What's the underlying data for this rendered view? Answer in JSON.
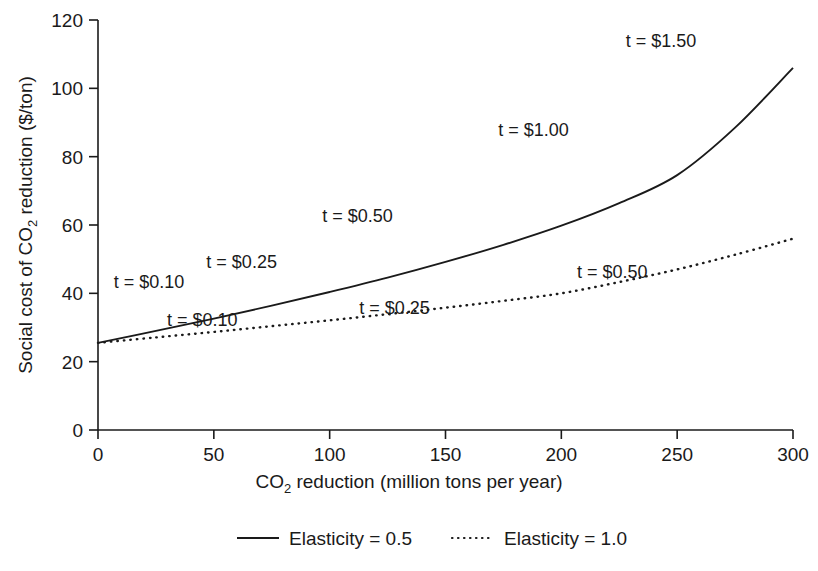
{
  "chart_data": {
    "type": "line",
    "title": "",
    "xlabel": "CO2 reduction (million tons per year)",
    "xlabel_parts": {
      "pre": "CO",
      "sub": "2",
      "post": " reduction (million tons per year)"
    },
    "ylabel": "Social cost of CO2 reduction ($/ton)",
    "ylabel_parts": {
      "pre": "Social cost of CO",
      "sub": "2",
      "post": " reduction ($/ton)"
    },
    "xlim": [
      0,
      300
    ],
    "ylim": [
      0,
      120
    ],
    "xticks": [
      0,
      50,
      100,
      150,
      200,
      250,
      300
    ],
    "xtick_labels": [
      "0",
      "50",
      "100",
      "150",
      "200",
      "250",
      "300"
    ],
    "yticks": [
      0,
      20,
      40,
      60,
      80,
      100,
      120
    ],
    "ytick_labels": [
      "0",
      "20",
      "40",
      "60",
      "80",
      "100",
      "120"
    ],
    "grid": false,
    "legend_position": "below",
    "series": [
      {
        "name": "Elasticity = 0.5",
        "style": "solid",
        "x": [
          0,
          25,
          50,
          75,
          100,
          125,
          150,
          175,
          200,
          225,
          250,
          275,
          300
        ],
        "values": [
          25.5,
          29.0,
          32.6,
          36.4,
          40.4,
          44.6,
          49.2,
          54.2,
          59.8,
          66.4,
          74.6,
          88.5,
          106.0
        ]
      },
      {
        "name": "Elasticity = 1.0",
        "style": "dotted",
        "x": [
          0,
          25,
          50,
          75,
          100,
          125,
          150,
          175,
          200,
          225,
          250,
          275,
          300
        ],
        "values": [
          25.5,
          27.1,
          28.7,
          30.4,
          32.1,
          33.9,
          35.8,
          37.8,
          40.0,
          43.3,
          47.0,
          51.3,
          56.0
        ]
      }
    ],
    "annotations": [
      {
        "text": "t = $0.10",
        "x_data": 22,
        "y_data": 41.5,
        "series": "Elasticity = 0.5"
      },
      {
        "text": "t = $0.25",
        "x_data": 62,
        "y_data": 47.5,
        "series": "Elasticity = 0.5"
      },
      {
        "text": "t = $0.50",
        "x_data": 112,
        "y_data": 61.0,
        "series": "Elasticity = 0.5"
      },
      {
        "text": "t = $1.00",
        "x_data": 188,
        "y_data": 86.0,
        "series": "Elasticity = 0.5"
      },
      {
        "text": "t = $1.50",
        "x_data": 243,
        "y_data": 112.0,
        "series": "Elasticity = 0.5"
      },
      {
        "text": "t = $0.10",
        "x_data": 45,
        "y_data": 30.5,
        "series": "Elasticity = 1.0"
      },
      {
        "text": "t = $0.25",
        "x_data": 128,
        "y_data": 34.0,
        "series": "Elasticity = 1.0"
      },
      {
        "text": "t = $0.50",
        "x_data": 222,
        "y_data": 44.5,
        "series": "Elasticity = 1.0"
      }
    ]
  },
  "legend": {
    "items": [
      {
        "label": "Elasticity = 0.5",
        "style": "solid"
      },
      {
        "label": "Elasticity = 1.0",
        "style": "dotted"
      }
    ]
  },
  "colors": {
    "ink": "#1a1a1a",
    "background": "#ffffff"
  }
}
